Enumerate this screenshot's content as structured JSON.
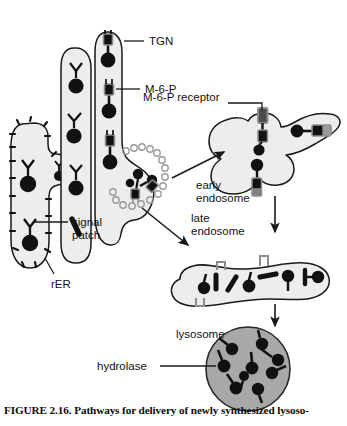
{
  "figure": {
    "caption": "FIGURE 2.16. Pathways for delivery of newly synthesized lysoso-",
    "width": 347,
    "height": 426
  },
  "colors": {
    "organelle_fill": "#ededed",
    "organelle_stroke": "#1a1a1a",
    "lysosome_fill": "#a8a8a8",
    "lysosome_stroke": "#2a2a2a",
    "molecule_dark": "#111111",
    "receptor_gray": "#8d8d8d",
    "coat_circle_stroke": "#9a9a9a",
    "label_text": "#111111",
    "background": "#ffffff"
  },
  "labels": {
    "tgn": "TGN",
    "m6p": "M-6-P",
    "m6p_receptor": "M-6-P receptor",
    "early_endosome_line1": "early",
    "early_endosome_line2": "endosome",
    "late_endosome_line1": "late",
    "late_endosome_line2": "endosome",
    "signal_line1": "signal",
    "signal_line2": "patch",
    "rer": "rER",
    "lysosome": "lysosome",
    "hydrolase": "hydrolase"
  },
  "diagram_data": {
    "type": "cell-biology-pathway",
    "organelles": [
      {
        "name": "rER",
        "shape": "elongated-cisterna-with-bud",
        "fill": "#ededed",
        "contents": "hydrolases with signal patch, ribosomes on surface"
      },
      {
        "name": "golgi-cisterna-2",
        "shape": "elongated-cisterna",
        "fill": "#ededed",
        "contents": "hydrolases with signal patch"
      },
      {
        "name": "golgi-cisterna-tgn",
        "shape": "elongated-cisterna-with-budding-vesicle",
        "fill": "#ededed",
        "contents": "hydrolases tagged with M-6-P bound to receptors"
      },
      {
        "name": "early-endosome",
        "shape": "irregular-lobed",
        "fill": "#ededed",
        "contents": "M-6-P receptors with bound hydrolases"
      },
      {
        "name": "late-endosome",
        "shape": "irregular-elongated",
        "fill": "#ededed",
        "contents": "free hydrolases, empty receptors"
      },
      {
        "name": "lysosome",
        "shape": "circle",
        "fill": "#a8a8a8",
        "contents": "free hydrolases"
      }
    ],
    "pathway_steps": [
      "rER synthesis with signal patch",
      "Golgi transit and M-6-P tagging",
      "TGN sorting into clathrin-coated vesicle",
      "delivery to early endosome",
      "maturation to late endosome and receptor dissociation",
      "delivery to lysosome"
    ],
    "hydrolase_counts": {
      "lysosome": 9,
      "late_endosome": 7
    }
  }
}
